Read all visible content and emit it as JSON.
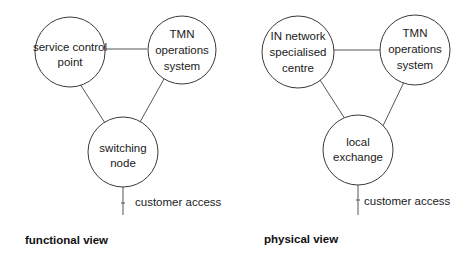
{
  "diagrams": [
    {
      "caption": "functional view",
      "nodes": [
        {
          "id": "scp",
          "lines": [
            "service control",
            "point"
          ]
        },
        {
          "id": "tmn",
          "lines": [
            "TMN",
            "operations",
            "system"
          ]
        },
        {
          "id": "switch",
          "lines": [
            "switching",
            "node"
          ]
        }
      ],
      "edges": [
        [
          "scp",
          "tmn"
        ],
        [
          "scp",
          "switch"
        ],
        [
          "tmn",
          "switch"
        ]
      ],
      "access_label": "customer access"
    },
    {
      "caption": "physical view",
      "nodes": [
        {
          "id": "insc",
          "lines": [
            "IN network",
            "specialised",
            "centre"
          ]
        },
        {
          "id": "tmn",
          "lines": [
            "TMN",
            "operations",
            "system"
          ]
        },
        {
          "id": "le",
          "lines": [
            "local",
            "exchange"
          ]
        }
      ],
      "edges": [
        [
          "insc",
          "tmn"
        ],
        [
          "insc",
          "le"
        ],
        [
          "tmn",
          "le"
        ]
      ],
      "access_label": "customer access"
    }
  ]
}
